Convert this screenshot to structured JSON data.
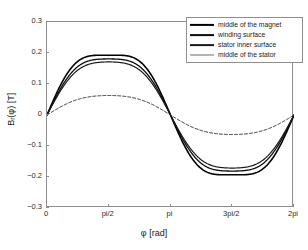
{
  "chart_data": {
    "type": "line",
    "title": "",
    "xlabel": "φ [rad]",
    "ylabel": "B_r(φ) [T]",
    "ylabel_parts": {
      "main": "B",
      "sub": "r",
      "rest": "(φ) [T]"
    },
    "xlim": [
      0,
      6.283185307
    ],
    "ylim": [
      -0.3,
      0.3
    ],
    "grid": false,
    "legend_position": "top-right",
    "xticks": [
      {
        "value": 0,
        "label": "0"
      },
      {
        "value": 1.570796327,
        "label": "pi/2"
      },
      {
        "value": 3.141592654,
        "label": "pi"
      },
      {
        "value": 4.71238898,
        "label": "3pi/2"
      },
      {
        "value": 6.283185307,
        "label": "2pi"
      }
    ],
    "yticks": [
      {
        "value": 0.3,
        "label": "0.3"
      },
      {
        "value": 0.2,
        "label": "0.2"
      },
      {
        "value": 0.1,
        "label": "0.1"
      },
      {
        "value": 0.0,
        "label": "0"
      },
      {
        "value": -0.1,
        "label": "−0.1"
      },
      {
        "value": -0.2,
        "label": "−0.2"
      },
      {
        "value": -0.3,
        "label": "−0.3"
      }
    ],
    "series": [
      {
        "name": "middle of the magnet",
        "color": "#000000",
        "width": 1.6,
        "dash": "none",
        "amplitude": 0.245,
        "flatness": 0.12,
        "x": [
          0,
          0.3927,
          0.7854,
          1.1781,
          1.5708,
          1.9635,
          2.3562,
          2.7489,
          3.1416,
          3.5343,
          3.927,
          4.3197,
          4.7124,
          5.1051,
          5.4978,
          5.8905,
          6.2832
        ],
        "values": [
          0,
          0.112,
          0.193,
          0.234,
          0.245,
          0.234,
          0.193,
          0.112,
          0,
          -0.112,
          -0.193,
          -0.234,
          -0.245,
          -0.234,
          -0.193,
          -0.112,
          0
        ]
      },
      {
        "name": "winding surface",
        "color": "#0d0d0d",
        "width": 1.3,
        "dash": "none",
        "amplitude": 0.221,
        "flatness": 0.1,
        "x": [
          0,
          0.3927,
          0.7854,
          1.1781,
          1.5708,
          1.9635,
          2.3562,
          2.7489,
          3.1416,
          3.5343,
          3.927,
          4.3197,
          4.7124,
          5.1051,
          5.4978,
          5.8905,
          6.2832
        ],
        "values": [
          0,
          0.101,
          0.175,
          0.211,
          0.221,
          0.211,
          0.175,
          0.101,
          0,
          -0.101,
          -0.175,
          -0.211,
          -0.221,
          -0.211,
          -0.175,
          -0.101,
          0
        ]
      },
      {
        "name": "stator inner surface",
        "color": "#1a1a1a",
        "width": 1.2,
        "dash": "none",
        "amplitude": 0.205,
        "flatness": 0.09,
        "x": [
          0,
          0.3927,
          0.7854,
          1.1781,
          1.5708,
          1.9635,
          2.3562,
          2.7489,
          3.1416,
          3.5343,
          3.927,
          4.3197,
          4.7124,
          5.1051,
          5.4978,
          5.8905,
          6.2832
        ],
        "values": [
          0,
          0.094,
          0.163,
          0.196,
          0.205,
          0.196,
          0.163,
          0.094,
          0,
          -0.094,
          -0.163,
          -0.196,
          -0.205,
          -0.196,
          -0.163,
          -0.094,
          0
        ]
      },
      {
        "name": "middle of the stator",
        "color": "#2e2e2e",
        "width": 1.0,
        "dash": "3,2",
        "amplitude": 0.071,
        "flatness": 0.06,
        "x": [
          0,
          0.3927,
          0.7854,
          1.1781,
          1.5708,
          1.9635,
          2.3562,
          2.7489,
          3.1416,
          3.5343,
          3.927,
          4.3197,
          4.7124,
          5.1051,
          5.4978,
          5.8905,
          6.2832
        ],
        "values": [
          0,
          0.033,
          0.057,
          0.068,
          0.071,
          0.068,
          0.057,
          0.033,
          0,
          -0.033,
          -0.057,
          -0.068,
          -0.071,
          -0.068,
          -0.057,
          -0.033,
          0
        ]
      }
    ],
    "legend": [
      {
        "label": "middle of the magnet",
        "color": "#000000",
        "width": 2.2,
        "dash": "none"
      },
      {
        "label": "winding surface",
        "color": "#0d0d0d",
        "width": 1.8,
        "dash": "none"
      },
      {
        "label": "stator inner surface",
        "color": "#1a1a1a",
        "width": 1.8,
        "dash": "none"
      },
      {
        "label": "middle of the stator",
        "color": "#6b6b6b",
        "width": 1.0,
        "dash": "none"
      }
    ]
  },
  "axes": {
    "frame_color": "#8e8e8e",
    "background": "#ffffff"
  }
}
